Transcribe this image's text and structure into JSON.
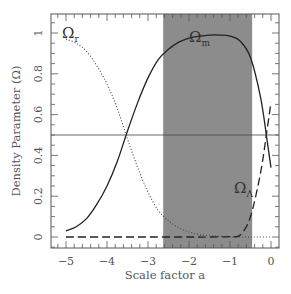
{
  "chart_data": {
    "type": "line",
    "title": "",
    "xlabel": "Scale factor a",
    "ylabel": "Density Parameter (Ω)",
    "xlim": [
      -5.37,
      0.2
    ],
    "ylim": [
      -0.06,
      1.1
    ],
    "x_ticks": [
      -5,
      -4,
      -3,
      -2,
      -1,
      0
    ],
    "x_tick_labels": [
      "−5",
      "−4",
      "−3",
      "−2",
      "−1",
      "0"
    ],
    "y_ticks": [
      0,
      0.2,
      0.4,
      0.6,
      0.8,
      1
    ],
    "y_tick_labels": [
      "0",
      "0.2",
      "0.4",
      "0.6",
      "0.8",
      "1"
    ],
    "grid": false,
    "reference_line": {
      "y": 0.5,
      "style": "solid thin"
    },
    "shaded_region": {
      "x_start": -2.63,
      "x_end": -0.46,
      "color": "#8c8c8c"
    },
    "series": [
      {
        "name": "Ω_r",
        "label_main": "Ω",
        "label_sub": "r",
        "style": "dotted",
        "x": [
          -5,
          -4.75,
          -4.5,
          -4.25,
          -4,
          -3.75,
          -3.5,
          -3.25,
          -3,
          -2.75,
          -2.5,
          -2.25,
          -2,
          -1.75,
          -1.5,
          -1.25,
          -1,
          -0.5,
          0
        ],
        "values": [
          0.97,
          0.95,
          0.91,
          0.84,
          0.75,
          0.63,
          0.48,
          0.34,
          0.22,
          0.13,
          0.08,
          0.045,
          0.025,
          0.012,
          0.006,
          0.003,
          0.001,
          0,
          0
        ]
      },
      {
        "name": "Ω_m",
        "label_main": "Ω",
        "label_sub": "m",
        "style": "solid",
        "x": [
          -5,
          -4.75,
          -4.5,
          -4.25,
          -4,
          -3.75,
          -3.5,
          -3.25,
          -3,
          -2.75,
          -2.5,
          -2.25,
          -2,
          -1.75,
          -1.5,
          -1.25,
          -1,
          -0.75,
          -0.5,
          -0.25,
          -0.1,
          0
        ],
        "values": [
          0.03,
          0.05,
          0.09,
          0.16,
          0.25,
          0.37,
          0.52,
          0.66,
          0.78,
          0.87,
          0.92,
          0.955,
          0.975,
          0.985,
          0.99,
          0.99,
          0.985,
          0.96,
          0.88,
          0.68,
          0.48,
          0.34
        ]
      },
      {
        "name": "Ω_Λ",
        "label_main": "Ω",
        "label_sub": "Λ",
        "style": "dashed",
        "x": [
          -5,
          -4,
          -3,
          -2,
          -1.5,
          -1,
          -0.75,
          -0.5,
          -0.25,
          -0.1,
          0
        ],
        "values": [
          0,
          0,
          0,
          0,
          0,
          0.002,
          0.01,
          0.1,
          0.32,
          0.52,
          0.66
        ]
      }
    ]
  }
}
